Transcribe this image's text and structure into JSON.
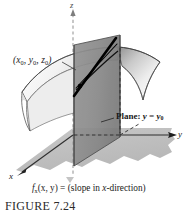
{
  "figure": {
    "number_label": "FIGURE 7.24",
    "caption": "f_x(x, y) = (slope in x-direction)",
    "caption_parts": {
      "fn_base": "f",
      "fn_sub": "x",
      "fn_args": "(x, y) = (slope in ",
      "fn_dir": "x",
      "fn_tail": "-direction)"
    }
  },
  "axes": {
    "z": {
      "label": "z",
      "orientation": "vertical-up",
      "style": "dashed"
    },
    "y": {
      "label": "y",
      "orientation": "right",
      "style": "solid-arrow"
    },
    "x": {
      "label": "x",
      "orientation": "down-left",
      "style": "solid-arrow"
    }
  },
  "annotations": {
    "point": {
      "text": "(x0, y0, z0)",
      "parts": [
        "(",
        "x",
        "0",
        ", ",
        "y",
        "0",
        ", ",
        "z",
        "0",
        ")"
      ]
    },
    "plane": {
      "prefix": "Plane: ",
      "var": "y",
      "equals": " = ",
      "value_base": "y",
      "value_sub": "0"
    }
  },
  "geometry": {
    "surface_description": "saddle-shaped surface z = f(x, y)",
    "cutting_plane_description": "vertical plane y = y0 slicing the surface",
    "tangent_line_description": "thick black tangent line in x-direction at the point",
    "ground_plane_description": "shaded xy-plane region"
  },
  "colors": {
    "background": "#ffffff",
    "plane_fill": "#8a8a8a",
    "plane_fill_dark": "#7a7a7a",
    "ground_fill": "#bdbdbd",
    "surface_light": "#fbfbfb",
    "surface_mid": "#d6d6d6",
    "surface_dark": "#9f9f9f",
    "outline": "#3a3a3a",
    "tangent_line": "#000000",
    "axis_dashed": "#9a9a9a",
    "text": "#1a1a1a",
    "figure_number_text": "#2b2b2b"
  }
}
